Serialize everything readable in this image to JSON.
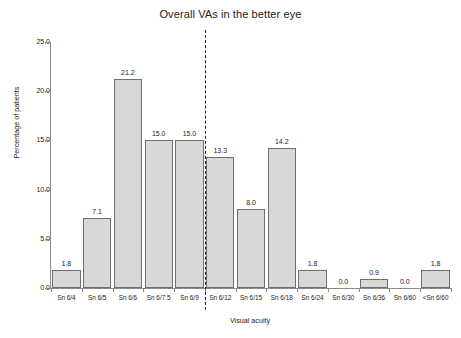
{
  "chart_data": {
    "type": "bar",
    "title": "Overall VAs in the better eye",
    "xlabel": "Visual acuity",
    "ylabel": "Percentage of patients",
    "categories": [
      "Sn 6/4",
      "Sn 6/5",
      "Sn 6/6",
      "Sn 6/7.5",
      "Sn 6/9",
      "Sn 6/12",
      "Sn 6/15",
      "Sn 6/18",
      "Sn 6/24",
      "Sn 6/30",
      "Sn 6/36",
      "Sn 6/60",
      "<Sn 6/60"
    ],
    "values": [
      1.8,
      7.1,
      21.2,
      15.0,
      15.0,
      13.3,
      8.0,
      14.2,
      1.8,
      0.0,
      0.9,
      0.0,
      1.8
    ],
    "value_labels": [
      "1.8",
      "7.1",
      "21.2",
      "15.0",
      "15.0",
      "13.3",
      "8.0",
      "14.2",
      "1.8",
      "0.0",
      "0.9",
      "0.0",
      "1.8"
    ],
    "ylim": [
      0.0,
      25.0
    ],
    "ytick_values": [
      0.0,
      5.0,
      10.0,
      15.0,
      20.0,
      25.0
    ],
    "ytick_labels": [
      "0.0",
      "5.0",
      "10.0",
      "15.0",
      "20.0",
      "25.0"
    ],
    "grid": false,
    "legend": null,
    "annotations": [
      {
        "type": "vertical-dashed-line",
        "name": "threshold-divider",
        "between_categories": [
          "Sn 6/9",
          "Sn 6/12"
        ],
        "category_index": 5
      }
    ],
    "bar_color": "#d8d8d8",
    "bar_edge_color": "#6e6e6e",
    "axis_color": "#8a8a8a",
    "text_color": "#222222",
    "background": "#ffffff"
  }
}
